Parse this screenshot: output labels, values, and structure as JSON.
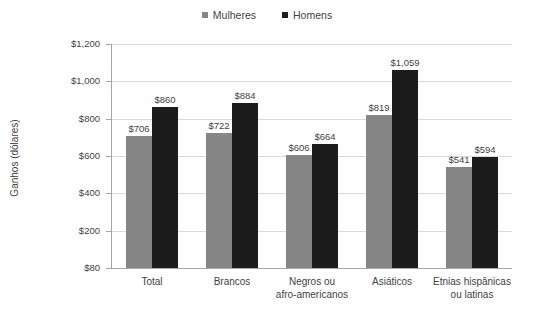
{
  "chart_data": {
    "type": "bar",
    "title": "",
    "xlabel": "",
    "ylabel": "Ganhos (dólares)",
    "ylim": [
      0,
      1200
    ],
    "grid": true,
    "legend_position": "top-center",
    "categories": [
      "Total",
      "Brancos",
      "Negros ou afro-americanos",
      "Asiáticos",
      "Etnias hispânicas ou latinas"
    ],
    "category_lines": [
      [
        "Total"
      ],
      [
        "Brancos"
      ],
      [
        "Negros ou",
        "afro-americanos"
      ],
      [
        "Asiáticos"
      ],
      [
        "Etnias hispânicas",
        "ou latinas"
      ]
    ],
    "series": [
      {
        "name": "Mulheres",
        "color": "#858585",
        "values": [
          706,
          722,
          606,
          819,
          541
        ],
        "labels": [
          "$706",
          "$722",
          "$606",
          "$819",
          "$541"
        ]
      },
      {
        "name": "Homens",
        "color": "#1c1c1c",
        "values": [
          860,
          884,
          664,
          1059,
          594
        ],
        "labels": [
          "$860",
          "$884",
          "$664",
          "$1,059",
          "$594"
        ]
      }
    ],
    "y_ticks": [
      {
        "value": 1200,
        "label": "$1,200"
      },
      {
        "value": 1000,
        "label": "$1,000"
      },
      {
        "value": 800,
        "label": "$800"
      },
      {
        "value": 600,
        "label": "$600"
      },
      {
        "value": 400,
        "label": "$400"
      },
      {
        "value": 200,
        "label": "$200"
      },
      {
        "value": 0,
        "label": "$80"
      }
    ]
  },
  "colors": {
    "grid": "#d9d9d9",
    "axis": "#a6a6a6",
    "text": "#3f3f3f",
    "background": "#ffffff"
  }
}
